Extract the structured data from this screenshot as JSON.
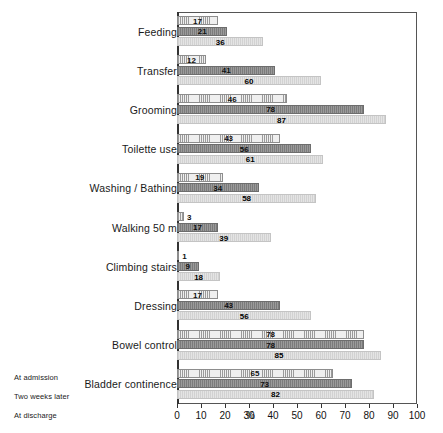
{
  "chart_data": {
    "type": "bar",
    "orientation": "horizontal",
    "title": "",
    "xlabel": "%",
    "ylabel": "",
    "xlim": [
      0,
      100
    ],
    "grid": false,
    "legend_position": "bottom-left",
    "xticks": [
      0,
      10,
      20,
      30,
      40,
      50,
      60,
      70,
      80,
      90,
      100
    ],
    "xtick_labels": [
      "0",
      "10",
      "20",
      "30",
      "40",
      "50",
      "60",
      "70",
      "80",
      "90",
      "100"
    ],
    "categories": [
      "Feeding",
      "Transfer",
      "Grooming",
      "Toilette  use",
      "Washing / Bathing",
      "Walking 50 m",
      "Climbing stairs",
      "Dressing",
      "Bowel control",
      "Bladder continence"
    ],
    "series": [
      {
        "name": "At admission",
        "values": [
          17,
          12,
          46,
          43,
          19,
          3,
          1,
          17,
          78,
          65
        ]
      },
      {
        "name": "Two weeks  later",
        "values": [
          21,
          41,
          78,
          56,
          34,
          17,
          9,
          43,
          78,
          73
        ]
      },
      {
        "name": "At discharge",
        "values": [
          36,
          60,
          87,
          61,
          58,
          39,
          18,
          56,
          85,
          82
        ]
      }
    ]
  },
  "axis": {
    "percent_symbol": "%"
  },
  "legend": {
    "items": [
      {
        "label": "At admission"
      },
      {
        "label": "Two weeks  later"
      },
      {
        "label": "At discharge"
      }
    ]
  }
}
